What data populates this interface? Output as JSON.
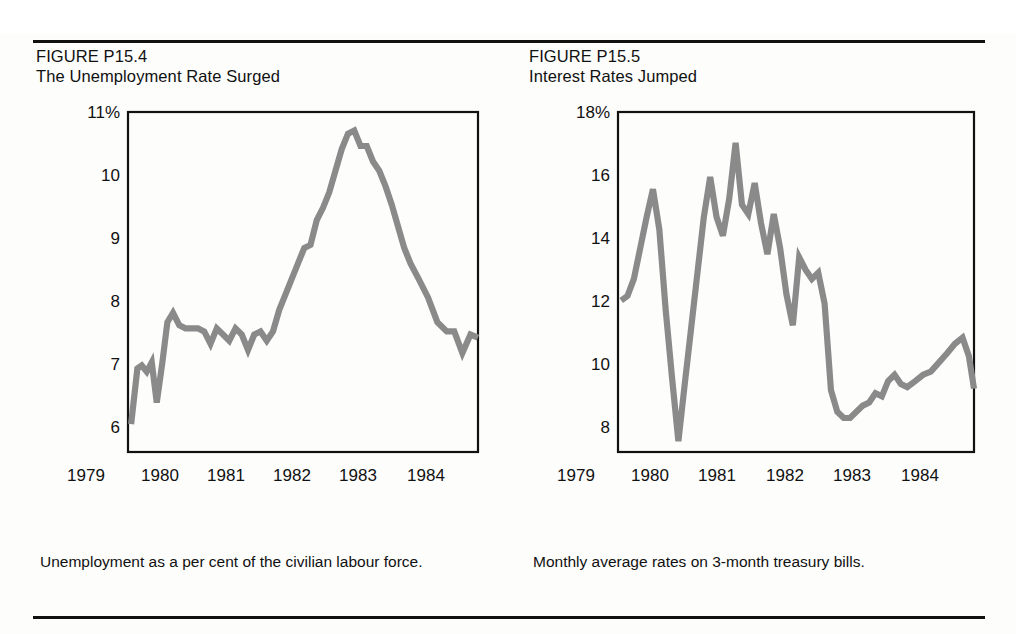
{
  "page": {
    "background_color": "#fdfdfc",
    "rule_color": "#111111"
  },
  "figures": [
    {
      "id": "P15.4",
      "number_label": "FIGURE P15.4",
      "title": "The Unemployment Rate Surged",
      "caption": "Unemployment as a per cent of the civilian labour force.",
      "line_color": "#8a8a8a"
    },
    {
      "id": "P15.5",
      "number_label": "FIGURE P15.5",
      "title": "Interest Rates Jumped",
      "caption": "Monthly average rates on 3-month treasury bills.",
      "line_color": "#8a8a8a"
    }
  ],
  "chart_data": [
    {
      "type": "line",
      "title": "The Unemployment Rate Surged",
      "xlabel": "",
      "ylabel": "",
      "ylim": [
        5.5,
        11.0
      ],
      "xlim": [
        1979.4,
        1985.0
      ],
      "grid": false,
      "legend": "none",
      "ytick_labels": [
        "11%",
        "10",
        "9",
        "8",
        "7",
        "6"
      ],
      "ytick_values": [
        11,
        10,
        9,
        8,
        7,
        6
      ],
      "xtick_labels": [
        "1979",
        "1980",
        "1981",
        "1982",
        "1983",
        "1984"
      ],
      "xtick_values": [
        1979,
        1980,
        1981,
        1982,
        1983,
        1984
      ],
      "series": [
        {
          "name": "Unemployment rate (per cent)",
          "x": [
            1979.45,
            1979.55,
            1979.62,
            1979.7,
            1979.78,
            1979.86,
            1979.95,
            1980.03,
            1980.12,
            1980.22,
            1980.32,
            1980.42,
            1980.52,
            1980.62,
            1980.72,
            1980.82,
            1980.92,
            1981.02,
            1981.12,
            1981.22,
            1981.32,
            1981.42,
            1981.52,
            1981.62,
            1981.72,
            1981.82,
            1981.92,
            1982.02,
            1982.12,
            1982.22,
            1982.32,
            1982.42,
            1982.52,
            1982.62,
            1982.72,
            1982.82,
            1982.92,
            1983.02,
            1983.12,
            1983.22,
            1983.32,
            1983.42,
            1983.52,
            1983.62,
            1983.72,
            1983.82,
            1983.92,
            1984.05,
            1984.2,
            1984.35,
            1984.5,
            1984.62,
            1984.75,
            1984.88,
            1985.0
          ],
          "y": [
            5.95,
            6.85,
            6.9,
            6.8,
            6.95,
            6.3,
            6.95,
            7.6,
            7.75,
            7.55,
            7.5,
            7.5,
            7.5,
            7.45,
            7.25,
            7.5,
            7.4,
            7.3,
            7.5,
            7.4,
            7.15,
            7.4,
            7.45,
            7.3,
            7.45,
            7.8,
            8.05,
            8.3,
            8.55,
            8.8,
            8.85,
            9.25,
            9.45,
            9.7,
            10.05,
            10.4,
            10.65,
            10.7,
            10.45,
            10.45,
            10.2,
            10.05,
            9.8,
            9.5,
            9.15,
            8.8,
            8.55,
            8.3,
            8.0,
            7.6,
            7.45,
            7.45,
            7.1,
            7.4,
            7.35
          ]
        }
      ]
    },
    {
      "type": "line",
      "title": "Interest Rates Jumped",
      "xlabel": "",
      "ylabel": "",
      "ylim": [
        7.0,
        18.0
      ],
      "xlim": [
        1979.4,
        1985.0
      ],
      "grid": false,
      "legend": "none",
      "ytick_labels": [
        "18%",
        "16",
        "14",
        "12",
        "10",
        "8"
      ],
      "ytick_values": [
        18,
        16,
        14,
        12,
        10,
        8
      ],
      "xtick_labels": [
        "1979",
        "1980",
        "1981",
        "1982",
        "1983",
        "1984"
      ],
      "xtick_values": [
        1979,
        1980,
        1981,
        1982,
        1983,
        1984
      ],
      "series": [
        {
          "name": "3-month treasury bill rate (per cent)",
          "x": [
            1979.45,
            1979.55,
            1979.65,
            1979.75,
            1979.85,
            1979.95,
            1980.05,
            1980.15,
            1980.25,
            1980.35,
            1980.45,
            1980.55,
            1980.65,
            1980.75,
            1980.85,
            1980.95,
            1981.05,
            1981.15,
            1981.25,
            1981.35,
            1981.45,
            1981.55,
            1981.65,
            1981.75,
            1981.85,
            1981.95,
            1982.05,
            1982.15,
            1982.25,
            1982.35,
            1982.45,
            1982.55,
            1982.65,
            1982.75,
            1982.85,
            1982.95,
            1983.05,
            1983.15,
            1983.25,
            1983.35,
            1983.45,
            1983.55,
            1983.65,
            1983.75,
            1983.85,
            1983.95,
            1984.08,
            1984.2,
            1984.32,
            1984.45,
            1984.58,
            1984.7,
            1984.82,
            1984.92,
            1985.0
          ],
          "y": [
            11.9,
            12.05,
            12.6,
            13.6,
            14.6,
            15.5,
            14.2,
            11.6,
            9.4,
            7.35,
            9.2,
            11.0,
            12.8,
            14.6,
            15.9,
            14.6,
            14.0,
            15.2,
            17.0,
            15.0,
            14.7,
            15.7,
            14.4,
            13.4,
            14.7,
            13.6,
            12.1,
            11.1,
            13.3,
            12.9,
            12.6,
            12.8,
            11.8,
            9.0,
            8.3,
            8.1,
            8.1,
            8.3,
            8.5,
            8.6,
            8.9,
            8.8,
            9.3,
            9.5,
            9.2,
            9.1,
            9.3,
            9.5,
            9.6,
            9.9,
            10.2,
            10.5,
            10.7,
            10.1,
            9.05
          ]
        }
      ]
    }
  ]
}
